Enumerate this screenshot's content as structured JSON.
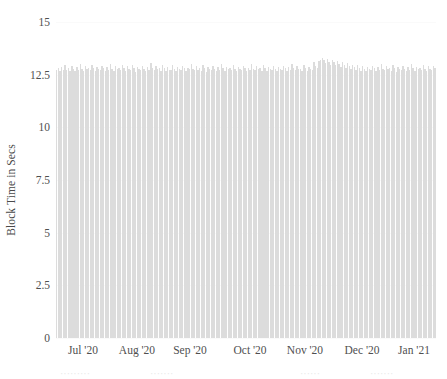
{
  "chart_data": {
    "type": "bar",
    "title": "",
    "xlabel": "",
    "ylabel": "Block Time in Secs",
    "ylim": [
      0,
      15
    ],
    "yticks": [
      0,
      2.5,
      5,
      7.5,
      10,
      12.5,
      15
    ],
    "ytick_labels": [
      "0",
      "2.5",
      "5",
      "7.5",
      "10",
      "12.5",
      "15"
    ],
    "grid": true,
    "legend": null,
    "bar_color": "#dcdcdc",
    "x_tick_labels": [
      "Jul '20",
      "Aug '20",
      "Sep '20",
      "Oct '20",
      "Nov '20",
      "Dec '20",
      "Jan '21"
    ],
    "x_tick_positions": [
      83,
      137,
      190,
      250,
      305,
      362,
      414
    ],
    "x_axis_range": [
      "Jun '20",
      "Jan '21"
    ],
    "x_units": "day",
    "series": [
      {
        "name": "Average Block Time",
        "values": [
          12.72,
          12.8,
          12.67,
          12.88,
          12.74,
          12.95,
          12.7,
          12.83,
          12.66,
          12.91,
          12.78,
          12.69,
          12.86,
          12.74,
          13.02,
          12.79,
          12.68,
          12.9,
          12.75,
          12.83,
          12.71,
          12.96,
          12.8,
          12.67,
          12.88,
          12.77,
          12.7,
          12.93,
          12.81,
          12.66,
          12.85,
          12.74,
          12.99,
          12.78,
          12.69,
          12.91,
          12.76,
          12.84,
          12.7,
          12.97,
          12.82,
          12.68,
          12.89,
          12.75,
          12.72,
          12.94,
          12.8,
          12.65,
          12.87,
          12.76,
          12.71,
          12.92,
          12.79,
          12.67,
          12.85,
          12.73,
          13.05,
          12.81,
          12.7,
          12.9,
          12.77,
          12.83,
          12.69,
          12.98,
          12.8,
          12.66,
          12.88,
          12.74,
          12.72,
          12.95,
          12.79,
          12.68,
          12.86,
          12.75,
          12.71,
          12.93,
          12.82,
          12.67,
          12.84,
          12.76,
          13.01,
          12.78,
          12.7,
          12.89,
          12.74,
          12.81,
          12.68,
          12.96,
          12.8,
          12.65,
          12.87,
          12.77,
          12.72,
          12.91,
          12.79,
          12.66,
          12.85,
          12.73,
          12.99,
          12.82,
          12.69,
          12.88,
          12.75,
          12.8,
          12.7,
          12.94,
          12.78,
          12.67,
          12.86,
          12.76,
          12.71,
          12.92,
          12.81,
          12.68,
          12.84,
          12.74,
          13.0,
          12.79,
          12.7,
          12.9,
          12.77,
          12.83,
          12.69,
          12.97,
          12.8,
          12.66,
          12.87,
          12.75,
          12.73,
          12.93,
          12.78,
          12.68,
          12.85,
          12.76,
          12.72,
          12.91,
          12.82,
          12.67,
          12.88,
          12.74,
          13.03,
          12.81,
          12.7,
          12.89,
          12.75,
          12.79,
          12.68,
          12.95,
          12.84,
          12.66,
          12.86,
          12.77,
          12.74,
          13.08,
          12.92,
          12.83,
          13.15,
          13.22,
          13.3,
          13.18,
          13.05,
          13.24,
          13.12,
          12.98,
          13.2,
          13.09,
          12.95,
          13.16,
          13.02,
          12.88,
          13.1,
          12.96,
          12.82,
          13.04,
          12.9,
          12.76,
          12.98,
          12.85,
          12.72,
          12.94,
          12.8,
          12.69,
          12.91,
          12.78,
          12.66,
          12.88,
          12.75,
          12.71,
          12.93,
          12.81,
          12.67,
          12.85,
          12.74,
          12.99,
          12.79,
          12.7,
          12.9,
          12.76,
          12.83,
          12.68,
          12.96,
          12.8,
          12.65,
          12.87,
          12.77,
          12.72,
          12.92,
          12.79,
          12.66,
          12.86,
          12.73,
          13.01,
          12.82,
          12.69,
          12.88,
          12.75,
          12.8,
          12.7,
          12.94,
          12.78,
          12.67,
          12.89,
          12.76,
          12.71,
          12.91,
          12.84
        ]
      }
    ]
  },
  "axis": {
    "y_title": "Block Time in Secs"
  },
  "footer": {
    "fragments": [
      {
        "text": "·········",
        "left": 60
      },
      {
        "text": "·······",
        "left": 150
      },
      {
        "text": "······",
        "left": 300
      },
      {
        "text": "·······",
        "left": 370
      }
    ]
  }
}
